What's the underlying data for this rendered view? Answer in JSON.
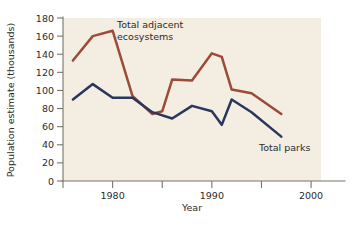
{
  "chart_data": {
    "type": "line",
    "title": "",
    "xlabel": "Year",
    "ylabel": "Population estimate (thousands)",
    "xlim": [
      1975,
      2001
    ],
    "ylim": [
      0,
      180
    ],
    "grid": false,
    "legend_position": "inline-annotations",
    "y_ticks": [
      0,
      20,
      40,
      60,
      80,
      100,
      120,
      140,
      160,
      180
    ],
    "y_tick_labels": [
      "0",
      "20",
      "40",
      "60",
      "80",
      "100",
      "120",
      "140",
      "160",
      "180"
    ],
    "x_ticks": [
      1975,
      1980,
      1985,
      1990,
      1995,
      2000
    ],
    "x_tick_labels": [
      "",
      "1980",
      "",
      "1990",
      "",
      "2000"
    ],
    "series": [
      {
        "name": "Total adjacent ecosystems",
        "color": "#9e4a38",
        "annotation": "Total adjacent\necosystems",
        "annotation_line1": "Total adjacent",
        "annotation_line2": "ecosystems",
        "x": [
          1976,
          1978,
          1980,
          1982,
          1984,
          1985,
          1986,
          1988,
          1990,
          1991,
          1992,
          1994,
          1997
        ],
        "values": [
          133,
          160,
          166,
          94,
          74,
          77,
          112,
          111,
          141,
          137,
          101,
          97,
          74
        ]
      },
      {
        "name": "Total parks",
        "color": "#28375c",
        "annotation": "Total parks",
        "annotation_line1": "Total parks",
        "annotation_line2": "",
        "x": [
          1976,
          1978,
          1980,
          1982,
          1984,
          1986,
          1988,
          1990,
          1991,
          1992,
          1994,
          1997
        ],
        "values": [
          90,
          107,
          92,
          92,
          76,
          69,
          83,
          77,
          62,
          90,
          76,
          49
        ]
      }
    ]
  },
  "colors": {
    "plot_background": "#f3ede2",
    "page_background": "#ffffff",
    "axis": "#7a7468",
    "text": "#2b2b2b",
    "series_ecosystems": "#9e4a38",
    "series_parks": "#28375c"
  }
}
